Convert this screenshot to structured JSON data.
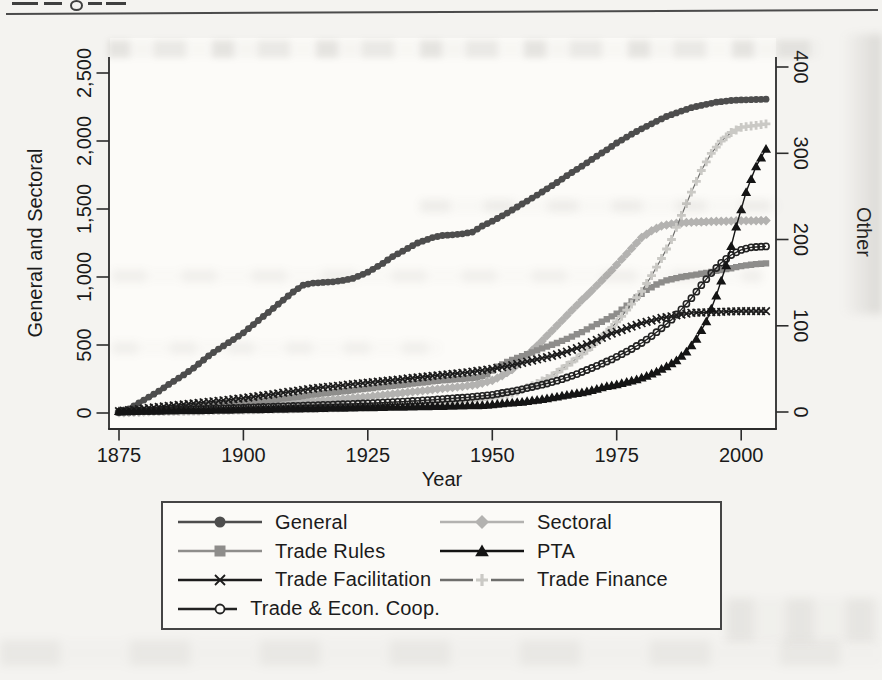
{
  "figure": {
    "x_axis": {
      "label": "Year",
      "ticks": [
        "1875",
        "1900",
        "1925",
        "1950",
        "1975",
        "2000"
      ]
    },
    "y_axis_left": {
      "label": "General and Sectoral",
      "ticks": [
        "0",
        "500",
        "1,000",
        "1,500",
        "2,000",
        "2,500"
      ]
    },
    "y_axis_right": {
      "label": "Other",
      "ticks": [
        "0",
        "100",
        "200",
        "300",
        "400"
      ]
    }
  },
  "legend": {
    "column_order": [
      [
        0,
        2,
        4,
        6
      ],
      [
        1,
        3,
        5
      ]
    ]
  },
  "chart_data": {
    "type": "line",
    "title": "",
    "xlabel": "Year",
    "ylabel_left": "General and Sectoral",
    "ylabel_right": "Other",
    "xlim": [
      1873,
      2007
    ],
    "ylim_left": [
      0,
      2500
    ],
    "ylim_right": [
      0,
      400
    ],
    "x_ticks": [
      1875,
      1900,
      1925,
      1950,
      1975,
      2000
    ],
    "y_ticks_left": [
      0,
      500,
      1000,
      1500,
      2000,
      2500
    ],
    "y_ticks_right": [
      0,
      100,
      200,
      300,
      400
    ],
    "grid": false,
    "legend_position": "bottom",
    "series": [
      {
        "name": "General",
        "axis": "left",
        "marker": "circle",
        "color": "#4d4d4d",
        "line_color": "#4d4d4d",
        "points": [
          [
            1875,
            5
          ],
          [
            1877,
            30
          ],
          [
            1880,
            95
          ],
          [
            1883,
            160
          ],
          [
            1885,
            210
          ],
          [
            1888,
            280
          ],
          [
            1890,
            330
          ],
          [
            1893,
            420
          ],
          [
            1895,
            470
          ],
          [
            1898,
            540
          ],
          [
            1900,
            590
          ],
          [
            1903,
            680
          ],
          [
            1905,
            740
          ],
          [
            1908,
            830
          ],
          [
            1910,
            890
          ],
          [
            1912,
            940
          ],
          [
            1914,
            955
          ],
          [
            1916,
            960
          ],
          [
            1918,
            965
          ],
          [
            1920,
            975
          ],
          [
            1922,
            990
          ],
          [
            1925,
            1035
          ],
          [
            1928,
            1100
          ],
          [
            1930,
            1150
          ],
          [
            1933,
            1210
          ],
          [
            1935,
            1250
          ],
          [
            1938,
            1290
          ],
          [
            1940,
            1305
          ],
          [
            1942,
            1310
          ],
          [
            1944,
            1318
          ],
          [
            1946,
            1330
          ],
          [
            1948,
            1375
          ],
          [
            1950,
            1410
          ],
          [
            1953,
            1470
          ],
          [
            1955,
            1515
          ],
          [
            1958,
            1580
          ],
          [
            1960,
            1625
          ],
          [
            1963,
            1695
          ],
          [
            1965,
            1745
          ],
          [
            1968,
            1815
          ],
          [
            1970,
            1865
          ],
          [
            1973,
            1935
          ],
          [
            1975,
            1985
          ],
          [
            1978,
            2050
          ],
          [
            1980,
            2090
          ],
          [
            1983,
            2145
          ],
          [
            1985,
            2180
          ],
          [
            1988,
            2220
          ],
          [
            1990,
            2245
          ],
          [
            1993,
            2270
          ],
          [
            1995,
            2285
          ],
          [
            1998,
            2298
          ],
          [
            2000,
            2302
          ],
          [
            2005,
            2307
          ]
        ]
      },
      {
        "name": "Sectoral",
        "axis": "left",
        "marker": "diamond",
        "color": "#b3b2b0",
        "line_color": "#b3b2b0",
        "points": [
          [
            1875,
            2
          ],
          [
            1880,
            8
          ],
          [
            1885,
            15
          ],
          [
            1890,
            25
          ],
          [
            1895,
            35
          ],
          [
            1900,
            45
          ],
          [
            1905,
            60
          ],
          [
            1910,
            75
          ],
          [
            1915,
            90
          ],
          [
            1920,
            105
          ],
          [
            1925,
            120
          ],
          [
            1930,
            140
          ],
          [
            1935,
            160
          ],
          [
            1940,
            180
          ],
          [
            1944,
            195
          ],
          [
            1947,
            210
          ],
          [
            1950,
            240
          ],
          [
            1952,
            275
          ],
          [
            1954,
            320
          ],
          [
            1956,
            390
          ],
          [
            1958,
            460
          ],
          [
            1960,
            530
          ],
          [
            1962,
            605
          ],
          [
            1964,
            680
          ],
          [
            1966,
            755
          ],
          [
            1968,
            830
          ],
          [
            1970,
            900
          ],
          [
            1972,
            975
          ],
          [
            1974,
            1050
          ],
          [
            1976,
            1130
          ],
          [
            1978,
            1210
          ],
          [
            1980,
            1290
          ],
          [
            1982,
            1340
          ],
          [
            1984,
            1375
          ],
          [
            1986,
            1390
          ],
          [
            1988,
            1398
          ],
          [
            1990,
            1403
          ],
          [
            1995,
            1409
          ],
          [
            2000,
            1413
          ],
          [
            2005,
            1415
          ]
        ]
      },
      {
        "name": "Trade Rules",
        "axis": "left",
        "marker": "square",
        "color": "#8e8d8b",
        "line_color": "#8e8d8b",
        "points": [
          [
            1875,
            2
          ],
          [
            1880,
            15
          ],
          [
            1885,
            30
          ],
          [
            1890,
            45
          ],
          [
            1895,
            60
          ],
          [
            1900,
            75
          ],
          [
            1905,
            95
          ],
          [
            1910,
            115
          ],
          [
            1915,
            140
          ],
          [
            1920,
            160
          ],
          [
            1925,
            180
          ],
          [
            1930,
            200
          ],
          [
            1935,
            220
          ],
          [
            1940,
            240
          ],
          [
            1944,
            252
          ],
          [
            1947,
            262
          ],
          [
            1949,
            285
          ],
          [
            1951,
            340
          ],
          [
            1953,
            375
          ],
          [
            1955,
            405
          ],
          [
            1958,
            445
          ],
          [
            1960,
            475
          ],
          [
            1963,
            515
          ],
          [
            1965,
            545
          ],
          [
            1968,
            595
          ],
          [
            1970,
            635
          ],
          [
            1973,
            690
          ],
          [
            1975,
            730
          ],
          [
            1977,
            790
          ],
          [
            1979,
            850
          ],
          [
            1981,
            905
          ],
          [
            1983,
            945
          ],
          [
            1985,
            975
          ],
          [
            1988,
            1000
          ],
          [
            1990,
            1012
          ],
          [
            1993,
            1030
          ],
          [
            1995,
            1045
          ],
          [
            1998,
            1065
          ],
          [
            2000,
            1080
          ],
          [
            2003,
            1095
          ],
          [
            2005,
            1100
          ]
        ]
      },
      {
        "name": "PTA",
        "axis": "right",
        "marker": "triangle",
        "color": "#141414",
        "line_color": "#141414",
        "points": [
          [
            1875,
            1
          ],
          [
            1890,
            2
          ],
          [
            1900,
            3
          ],
          [
            1910,
            4
          ],
          [
            1920,
            5
          ],
          [
            1930,
            6
          ],
          [
            1940,
            7
          ],
          [
            1948,
            8
          ],
          [
            1952,
            10
          ],
          [
            1956,
            12
          ],
          [
            1960,
            15
          ],
          [
            1963,
            18
          ],
          [
            1966,
            21
          ],
          [
            1969,
            24
          ],
          [
            1971,
            27
          ],
          [
            1973,
            30
          ],
          [
            1975,
            32
          ],
          [
            1977,
            35
          ],
          [
            1979,
            38
          ],
          [
            1981,
            42
          ],
          [
            1983,
            47
          ],
          [
            1985,
            53
          ],
          [
            1987,
            60
          ],
          [
            1989,
            70
          ],
          [
            1991,
            85
          ],
          [
            1993,
            105
          ],
          [
            1995,
            135
          ],
          [
            1997,
            170
          ],
          [
            1999,
            215
          ],
          [
            2001,
            255
          ],
          [
            2003,
            285
          ],
          [
            2005,
            305
          ]
        ]
      },
      {
        "name": "Trade Facilitation",
        "axis": "right",
        "marker": "x",
        "color": "#1c1c1c",
        "line_color": "#1c1c1c",
        "points": [
          [
            1875,
            1
          ],
          [
            1880,
            4
          ],
          [
            1885,
            7
          ],
          [
            1890,
            10
          ],
          [
            1895,
            13
          ],
          [
            1900,
            16
          ],
          [
            1905,
            20
          ],
          [
            1910,
            24
          ],
          [
            1915,
            28
          ],
          [
            1920,
            31
          ],
          [
            1925,
            34
          ],
          [
            1930,
            37
          ],
          [
            1935,
            40
          ],
          [
            1940,
            43
          ],
          [
            1945,
            46
          ],
          [
            1950,
            50
          ],
          [
            1953,
            53
          ],
          [
            1956,
            57
          ],
          [
            1959,
            61
          ],
          [
            1962,
            65
          ],
          [
            1965,
            70
          ],
          [
            1968,
            76
          ],
          [
            1970,
            81
          ],
          [
            1972,
            86
          ],
          [
            1974,
            91
          ],
          [
            1976,
            95
          ],
          [
            1978,
            99
          ],
          [
            1980,
            103
          ],
          [
            1982,
            106
          ],
          [
            1984,
            109
          ],
          [
            1986,
            111
          ],
          [
            1988,
            113
          ],
          [
            1990,
            115
          ],
          [
            1995,
            116
          ],
          [
            2000,
            117
          ],
          [
            2005,
            117
          ]
        ]
      },
      {
        "name": "Trade Finance",
        "axis": "right",
        "marker": "plus",
        "color": "#cac9c5",
        "line_color": "#6e6e6c",
        "points": [
          [
            1875,
            0
          ],
          [
            1890,
            1
          ],
          [
            1905,
            3
          ],
          [
            1920,
            5
          ],
          [
            1930,
            7
          ],
          [
            1940,
            10
          ],
          [
            1946,
            13
          ],
          [
            1950,
            16
          ],
          [
            1953,
            20
          ],
          [
            1956,
            26
          ],
          [
            1959,
            33
          ],
          [
            1962,
            42
          ],
          [
            1964,
            50
          ],
          [
            1966,
            58
          ],
          [
            1968,
            67
          ],
          [
            1970,
            76
          ],
          [
            1972,
            87
          ],
          [
            1974,
            98
          ],
          [
            1976,
            111
          ],
          [
            1978,
            125
          ],
          [
            1980,
            140
          ],
          [
            1982,
            158
          ],
          [
            1984,
            178
          ],
          [
            1986,
            200
          ],
          [
            1988,
            228
          ],
          [
            1990,
            255
          ],
          [
            1992,
            280
          ],
          [
            1994,
            300
          ],
          [
            1996,
            314
          ],
          [
            1998,
            324
          ],
          [
            2000,
            330
          ],
          [
            2005,
            334
          ]
        ]
      },
      {
        "name": "Trade & Econ. Coop.",
        "axis": "right",
        "marker": "circle-open",
        "color": "#222222",
        "line_color": "#222222",
        "points": [
          [
            1875,
            0
          ],
          [
            1885,
            2
          ],
          [
            1895,
            4
          ],
          [
            1905,
            6
          ],
          [
            1915,
            8
          ],
          [
            1925,
            10
          ],
          [
            1935,
            13
          ],
          [
            1945,
            17
          ],
          [
            1950,
            20
          ],
          [
            1955,
            25
          ],
          [
            1958,
            29
          ],
          [
            1961,
            33
          ],
          [
            1964,
            38
          ],
          [
            1967,
            44
          ],
          [
            1970,
            51
          ],
          [
            1972,
            56
          ],
          [
            1974,
            61
          ],
          [
            1976,
            67
          ],
          [
            1978,
            73
          ],
          [
            1980,
            80
          ],
          [
            1982,
            88
          ],
          [
            1984,
            97
          ],
          [
            1986,
            107
          ],
          [
            1988,
            119
          ],
          [
            1990,
            132
          ],
          [
            1992,
            147
          ],
          [
            1994,
            161
          ],
          [
            1996,
            173
          ],
          [
            1998,
            182
          ],
          [
            2000,
            188
          ],
          [
            2002,
            191
          ],
          [
            2005,
            192
          ]
        ]
      }
    ]
  }
}
